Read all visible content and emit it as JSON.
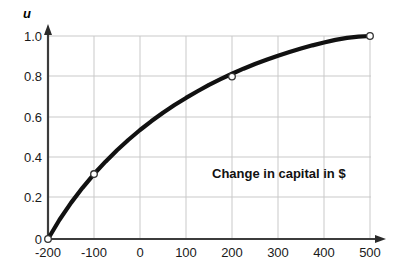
{
  "chart_data": {
    "type": "line",
    "title": "",
    "subtitle": "",
    "xlabel": "",
    "ylabel": "u",
    "annotation": "Change in capital in $",
    "xlim": [
      -200,
      500
    ],
    "ylim": [
      0,
      1.0
    ],
    "grid": true,
    "legend": "none",
    "xticks": [
      -200,
      -100,
      0,
      100,
      200,
      300,
      400,
      500
    ],
    "xtick_labels": [
      "-200",
      "-100",
      "0",
      "100",
      "200",
      "300",
      "400",
      "500"
    ],
    "yticks": [
      0,
      0.2,
      0.4,
      0.6,
      0.8,
      1.0
    ],
    "ytick_labels": [
      "0",
      "0.2",
      "0.4",
      "0.6",
      "0.8",
      "1.0"
    ],
    "series": [
      {
        "name": "utility-curve",
        "color": "#111111",
        "x": [
          -200,
          -175,
          -150,
          -125,
          -100,
          -75,
          -50,
          -25,
          0,
          25,
          50,
          75,
          100,
          125,
          150,
          175,
          200,
          225,
          250,
          275,
          300,
          325,
          350,
          375,
          400,
          425,
          450,
          475,
          500
        ],
        "y": [
          0.0,
          0.095,
          0.178,
          0.252,
          0.32,
          0.381,
          0.437,
          0.489,
          0.537,
          0.581,
          0.622,
          0.66,
          0.695,
          0.728,
          0.759,
          0.787,
          0.814,
          0.839,
          0.862,
          0.883,
          0.903,
          0.921,
          0.938,
          0.954,
          0.968,
          0.981,
          0.991,
          0.997,
          1.0
        ]
      }
    ],
    "markers": [
      {
        "name": "marker-start",
        "x": -200,
        "y": 0.0,
        "label": ""
      },
      {
        "name": "marker-mid-low",
        "x": -100,
        "y": 0.32,
        "label": ""
      },
      {
        "name": "marker-mid-high",
        "x": 200,
        "y": 0.8,
        "label": ""
      },
      {
        "name": "marker-end",
        "x": 500,
        "y": 1.0,
        "label": ""
      }
    ],
    "colors": {
      "curve": "#111111",
      "axis": "#3a3a3a",
      "grid": "#c8c8c8",
      "text": "#1a1a1a",
      "background": "#ffffff",
      "marker_fill": "#ffffff",
      "marker_stroke": "#333333"
    }
  }
}
